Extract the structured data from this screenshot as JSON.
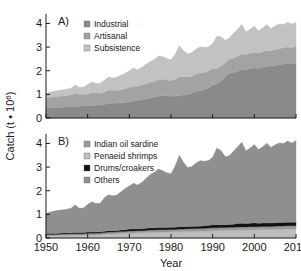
{
  "figure": {
    "ylabel": "Catch (t • 10⁶)",
    "xlabel": "Year",
    "panelA_label": "A)",
    "panelB_label": "B)"
  },
  "axes": {
    "x_ticks": [
      "1950",
      "1960",
      "1970",
      "1980",
      "1990",
      "2000",
      "2010"
    ],
    "y_ticks": [
      "0",
      "1",
      "2",
      "3",
      "4"
    ]
  },
  "colors": {
    "industrial": "#8a8a8a",
    "artisanal": "#a3a3a3",
    "subsistence": "#c2c2c2",
    "indian_oil_sardine": "#9a9a9a",
    "penaeid_shrimps": "#bdbdbd",
    "drums_croakers": "#111111",
    "others": "#8f8f8f",
    "axis": "#1a1a1a",
    "background": "#ffffff"
  },
  "legendA": [
    {
      "label": "Industrial",
      "color": "#8a8a8a"
    },
    {
      "label": "Artisanal",
      "color": "#a3a3a3"
    },
    {
      "label": "Subsistence",
      "color": "#c2c2c2"
    }
  ],
  "legendB": [
    {
      "label": "Indian oil sardine",
      "color": "#9a9a9a"
    },
    {
      "label": "Penaeid shrimps",
      "color": "#bdbdbd"
    },
    {
      "label": "Drums/croakers",
      "color": "#111111"
    },
    {
      "label": "Others",
      "color": "#8f8f8f"
    }
  ],
  "chart_data": [
    {
      "type": "area",
      "title": "A)",
      "xlabel": "Year",
      "ylabel": "Catch (t • 10⁶)",
      "xlim": [
        1950,
        2010
      ],
      "ylim": [
        0,
        4.4
      ],
      "grid": false,
      "legend_position": "top-left",
      "stacked": true,
      "x": [
        1950,
        1951,
        1952,
        1953,
        1954,
        1955,
        1956,
        1957,
        1958,
        1959,
        1960,
        1961,
        1962,
        1963,
        1964,
        1965,
        1966,
        1967,
        1968,
        1969,
        1970,
        1971,
        1972,
        1973,
        1974,
        1975,
        1976,
        1977,
        1978,
        1979,
        1980,
        1981,
        1982,
        1983,
        1984,
        1985,
        1986,
        1987,
        1988,
        1989,
        1990,
        1991,
        1992,
        1993,
        1994,
        1995,
        1996,
        1997,
        1998,
        1999,
        2000,
        2001,
        2002,
        2003,
        2004,
        2005,
        2006,
        2007,
        2008,
        2009,
        2010
      ],
      "series": [
        {
          "name": "Industrial",
          "values": [
            0.42,
            0.44,
            0.45,
            0.46,
            0.46,
            0.47,
            0.48,
            0.5,
            0.5,
            0.51,
            0.52,
            0.53,
            0.54,
            0.55,
            0.58,
            0.6,
            0.62,
            0.63,
            0.64,
            0.66,
            0.7,
            0.72,
            0.74,
            0.78,
            0.8,
            0.85,
            0.88,
            0.92,
            0.95,
            0.94,
            0.92,
            0.93,
            0.95,
            0.97,
            1.0,
            1.05,
            1.12,
            1.15,
            1.2,
            1.28,
            1.4,
            1.45,
            1.55,
            1.72,
            1.9,
            1.92,
            1.98,
            2.05,
            2.05,
            2.1,
            2.12,
            2.1,
            2.15,
            2.18,
            2.2,
            2.22,
            2.25,
            2.28,
            2.3,
            2.3,
            2.32
          ]
        },
        {
          "name": "Artisanal",
          "values": [
            0.42,
            0.44,
            0.45,
            0.46,
            0.47,
            0.48,
            0.5,
            0.55,
            0.5,
            0.48,
            0.5,
            0.55,
            0.52,
            0.5,
            0.52,
            0.58,
            0.55,
            0.54,
            0.56,
            0.58,
            0.6,
            0.62,
            0.6,
            0.62,
            0.65,
            0.66,
            0.68,
            0.7,
            0.7,
            0.68,
            0.66,
            0.72,
            0.8,
            0.78,
            0.74,
            0.72,
            0.74,
            0.76,
            0.74,
            0.72,
            0.7,
            0.66,
            0.64,
            0.62,
            0.6,
            0.62,
            0.64,
            0.66,
            0.64,
            0.66,
            0.66,
            0.64,
            0.66,
            0.68,
            0.66,
            0.68,
            0.68,
            0.7,
            0.7,
            0.68,
            0.72
          ]
        },
        {
          "name": "Subsistence",
          "values": [
            0.2,
            0.22,
            0.24,
            0.25,
            0.26,
            0.27,
            0.28,
            0.35,
            0.3,
            0.32,
            0.4,
            0.45,
            0.4,
            0.42,
            0.5,
            0.55,
            0.52,
            0.55,
            0.62,
            0.65,
            0.7,
            0.78,
            0.7,
            0.75,
            0.82,
            0.88,
            0.92,
            1.0,
            0.95,
            0.9,
            0.88,
            1.05,
            1.3,
            1.1,
            0.98,
            1.0,
            1.05,
            1.1,
            1.05,
            1.0,
            1.05,
            1.35,
            1.25,
            0.95,
            0.9,
            1.05,
            1.15,
            1.25,
            0.95,
            1.0,
            1.1,
            0.95,
            1.0,
            1.1,
            0.92,
            1.0,
            1.05,
            0.98,
            1.05,
            1.0,
            1.0
          ]
        }
      ]
    },
    {
      "type": "area",
      "title": "B)",
      "xlabel": "Year",
      "ylabel": "Catch (t • 10⁶)",
      "xlim": [
        1950,
        2010
      ],
      "ylim": [
        0,
        4.4
      ],
      "grid": false,
      "legend_position": "top-left",
      "stacked": true,
      "x": [
        1950,
        1951,
        1952,
        1953,
        1954,
        1955,
        1956,
        1957,
        1958,
        1959,
        1960,
        1961,
        1962,
        1963,
        1964,
        1965,
        1966,
        1967,
        1968,
        1969,
        1970,
        1971,
        1972,
        1973,
        1974,
        1975,
        1976,
        1977,
        1978,
        1979,
        1980,
        1981,
        1982,
        1983,
        1984,
        1985,
        1986,
        1987,
        1988,
        1989,
        1990,
        1991,
        1992,
        1993,
        1994,
        1995,
        1996,
        1997,
        1998,
        1999,
        2000,
        2001,
        2002,
        2003,
        2004,
        2005,
        2006,
        2007,
        2008,
        2009,
        2010
      ],
      "series": [
        {
          "name": "Penaeid shrimps",
          "values": [
            0.1,
            0.1,
            0.1,
            0.11,
            0.11,
            0.11,
            0.12,
            0.12,
            0.12,
            0.12,
            0.13,
            0.13,
            0.13,
            0.14,
            0.16,
            0.17,
            0.17,
            0.18,
            0.19,
            0.2,
            0.21,
            0.21,
            0.22,
            0.22,
            0.23,
            0.24,
            0.24,
            0.25,
            0.25,
            0.25,
            0.26,
            0.26,
            0.27,
            0.27,
            0.28,
            0.28,
            0.29,
            0.29,
            0.3,
            0.3,
            0.31,
            0.31,
            0.32,
            0.32,
            0.33,
            0.33,
            0.34,
            0.34,
            0.34,
            0.35,
            0.35,
            0.35,
            0.36,
            0.36,
            0.36,
            0.37,
            0.37,
            0.37,
            0.38,
            0.38,
            0.38
          ]
        },
        {
          "name": "Indian oil sardine",
          "values": [
            0.05,
            0.05,
            0.05,
            0.05,
            0.06,
            0.06,
            0.06,
            0.06,
            0.06,
            0.06,
            0.07,
            0.07,
            0.07,
            0.07,
            0.07,
            0.08,
            0.08,
            0.08,
            0.08,
            0.08,
            0.09,
            0.09,
            0.09,
            0.09,
            0.09,
            0.1,
            0.1,
            0.1,
            0.1,
            0.1,
            0.1,
            0.1,
            0.11,
            0.11,
            0.11,
            0.11,
            0.11,
            0.11,
            0.11,
            0.12,
            0.12,
            0.12,
            0.12,
            0.12,
            0.12,
            0.12,
            0.13,
            0.13,
            0.13,
            0.13,
            0.13,
            0.13,
            0.13,
            0.13,
            0.13,
            0.13,
            0.14,
            0.14,
            0.14,
            0.14,
            0.14
          ]
        },
        {
          "name": "Drums/croakers",
          "values": [
            0.04,
            0.04,
            0.04,
            0.04,
            0.04,
            0.04,
            0.04,
            0.05,
            0.05,
            0.05,
            0.05,
            0.05,
            0.05,
            0.05,
            0.06,
            0.06,
            0.06,
            0.06,
            0.07,
            0.07,
            0.08,
            0.08,
            0.08,
            0.08,
            0.09,
            0.09,
            0.09,
            0.09,
            0.09,
            0.09,
            0.09,
            0.09,
            0.1,
            0.1,
            0.1,
            0.1,
            0.1,
            0.1,
            0.11,
            0.11,
            0.13,
            0.13,
            0.12,
            0.12,
            0.12,
            0.13,
            0.14,
            0.15,
            0.14,
            0.14,
            0.16,
            0.14,
            0.14,
            0.15,
            0.14,
            0.15,
            0.15,
            0.15,
            0.15,
            0.15,
            0.15
          ]
        },
        {
          "name": "Others",
          "values": [
            0.85,
            0.91,
            0.95,
            0.97,
            0.98,
            1.01,
            1.04,
            1.17,
            1.03,
            1.04,
            1.17,
            1.28,
            1.21,
            1.21,
            1.41,
            1.52,
            1.48,
            1.5,
            1.62,
            1.74,
            1.82,
            1.94,
            1.85,
            1.96,
            2.11,
            2.26,
            2.35,
            2.48,
            2.41,
            2.32,
            2.27,
            2.6,
            3.02,
            2.72,
            2.49,
            2.53,
            2.67,
            2.77,
            2.73,
            2.75,
            2.86,
            3.25,
            3.14,
            2.88,
            2.91,
            3.09,
            3.25,
            3.43,
            3.08,
            3.19,
            3.32,
            3.12,
            3.23,
            3.37,
            3.2,
            3.3,
            3.36,
            3.34,
            3.43,
            3.35,
            3.45
          ]
        }
      ]
    }
  ]
}
